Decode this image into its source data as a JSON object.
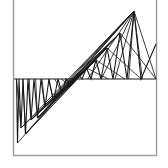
{
  "figure": {
    "title": "",
    "background_color": "#ffffff",
    "stroke_color": "#1a1a1a",
    "frame_color": "#9a9a9a",
    "canvas": {
      "width": 168,
      "height": 168
    },
    "frame": {
      "x": 13.5,
      "y": -6,
      "width": 143,
      "height": 161.5
    },
    "axis": {
      "name": "horizontal-axis",
      "x1": 14,
      "y1": 79,
      "x2": 156,
      "y2": 79
    }
  },
  "chart_data": {
    "type": "line",
    "title": "",
    "xlabel": "",
    "ylabel": "",
    "grid": false,
    "legend": null,
    "xlim": [
      0,
      1
    ],
    "ylim": [
      -1,
      1
    ],
    "baseline_y": 79,
    "vertices": [
      [
        16.5,
        79.0
      ],
      [
        17.5,
        143.0
      ],
      [
        19.0,
        79.0
      ],
      [
        21.0,
        128.0
      ],
      [
        23.0,
        79.0
      ],
      [
        25.5,
        134.0
      ],
      [
        28.0,
        79.0
      ],
      [
        31.0,
        120.0
      ],
      [
        34.0,
        79.0
      ],
      [
        37.5,
        118.0
      ],
      [
        41.0,
        79.0
      ],
      [
        45.0,
        107.0
      ],
      [
        49.0,
        79.0
      ],
      [
        53.5,
        101.0
      ],
      [
        58.0,
        79.0
      ],
      [
        62.0,
        93.0
      ],
      [
        66.0,
        79.0
      ],
      [
        70.0,
        86.0
      ],
      [
        74.0,
        79.0
      ],
      [
        78.0,
        74.0
      ],
      [
        82.0,
        79.0
      ],
      [
        86.5,
        68.0
      ],
      [
        91.0,
        79.0
      ],
      [
        96.0,
        60.0
      ],
      [
        101.0,
        79.0
      ],
      [
        107.0,
        48.0
      ],
      [
        113.0,
        79.0
      ],
      [
        120.0,
        33.0
      ],
      [
        127.0,
        79.0
      ],
      [
        134.0,
        11.0
      ],
      [
        141.0,
        79.0
      ],
      [
        156.0,
        44.0
      ]
    ],
    "upper_nodes": [
      [
        78.0,
        74.0
      ],
      [
        86.5,
        68.0
      ],
      [
        96.0,
        60.0
      ],
      [
        107.0,
        48.0
      ],
      [
        120.0,
        33.0
      ],
      [
        134.0,
        11.0
      ]
    ],
    "lower_nodes": [
      [
        17.5,
        143.0
      ],
      [
        21.0,
        128.0
      ],
      [
        25.5,
        134.0
      ],
      [
        31.0,
        120.0
      ],
      [
        37.5,
        118.0
      ],
      [
        45.0,
        107.0
      ],
      [
        53.5,
        101.0
      ],
      [
        62.0,
        93.0
      ],
      [
        70.0,
        86.0
      ]
    ],
    "chord_fan_origin": [
      74.0,
      79.0
    ],
    "chord_count": 22
  },
  "elements": {
    "plot_area_label": "string-art-plot",
    "frame_label": "plot-frame-border"
  }
}
